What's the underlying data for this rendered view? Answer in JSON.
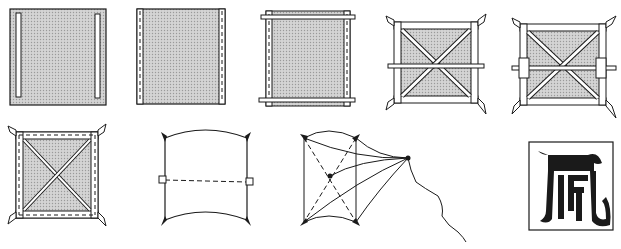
{
  "diagram": {
    "colors": {
      "ink": "#1a1a1a",
      "paper_shade": "#c8c8c8",
      "background": "#ffffff",
      "stick_fill": "#ffffff"
    },
    "steps": [
      {
        "id": 1,
        "description": "Square paper with two vertical slits near left and right edges"
      },
      {
        "id": 2,
        "description": "Edges folded over with dashed fold lines on both sides"
      },
      {
        "id": 3,
        "description": "Horizontal sticks added across top and bottom"
      },
      {
        "id": 4,
        "description": "Frame with diagonal cross sticks and a horizontal middle stick"
      },
      {
        "id": 5,
        "description": "Frame with diagonal cross sticks, middle stick and side blocks"
      },
      {
        "id": 6,
        "description": "Frame with diagonal cross and dashed paper edge borders"
      },
      {
        "id": 7,
        "description": "Bowed kite outline with dashed center line"
      },
      {
        "id": 8,
        "description": "Kite in perspective with bridle lines and flying string"
      },
      {
        "id": 9,
        "description": "Chinese character decoration (wind) in black on white square"
      }
    ],
    "decoration_character": "風"
  }
}
